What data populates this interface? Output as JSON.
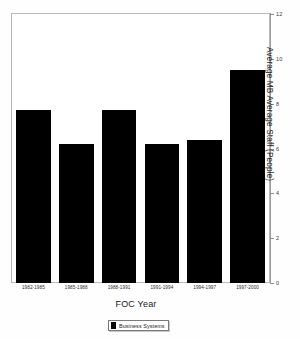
{
  "chart_data": {
    "type": "bar",
    "title": "",
    "xlabel": "FOC Year",
    "ylabel": "Average MB Average Staff (People)",
    "categories": [
      "1982-1985",
      "1985-1988",
      "1988-1991",
      "1991-1994",
      "1994-1997",
      "1997-2000"
    ],
    "series": [
      {
        "name": "Business Systems",
        "color": "#000000",
        "values": [
          7.7,
          6.2,
          7.7,
          6.2,
          6.4,
          9.5
        ]
      }
    ],
    "ylim": [
      0,
      12
    ],
    "yticks": [
      0,
      2,
      4,
      6,
      8,
      10,
      12
    ],
    "ytick_labels": [
      "0",
      "2",
      "4",
      "6",
      "8",
      "10",
      "12"
    ],
    "y_axis_position": "right",
    "grid": false,
    "legend_position": "bottom",
    "legend_entries": [
      "Business Systems"
    ]
  },
  "legend": {
    "label": "Business Systems"
  },
  "axes": {
    "x_title": "FOC Year",
    "y_title": "Average MB Average Staff (People)"
  },
  "colors": {
    "bar": "#000000",
    "frame": "#b9b9b9",
    "background": "#ffffff"
  }
}
